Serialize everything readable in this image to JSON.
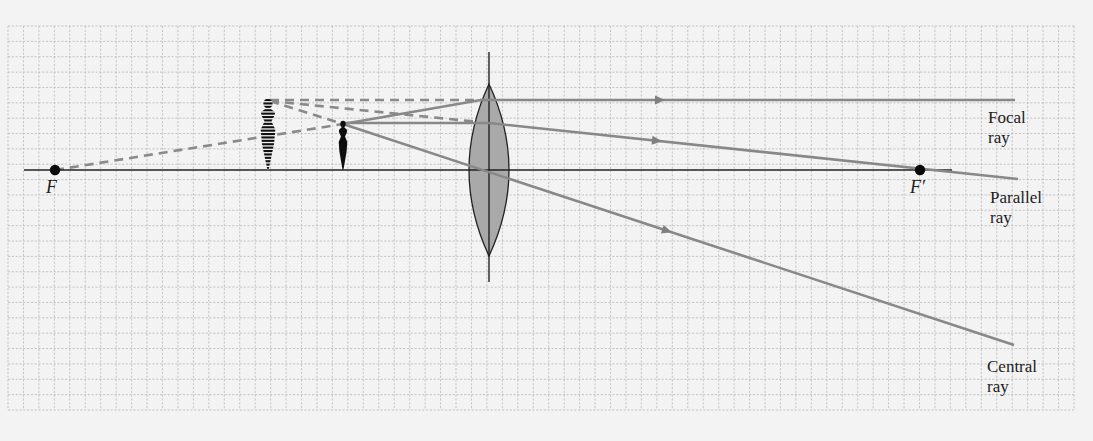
{
  "figure": {
    "colors": {
      "background": "#f3f3f3",
      "grid": "#b9b9b9",
      "ray": "#888888",
      "axis": "#222222",
      "lens_fill": "#a9a9a9"
    },
    "grid": {
      "x0": 8,
      "y0": 26,
      "x1": 1074,
      "y1": 410,
      "cols": 69,
      "rows": 25
    },
    "optical_axis": {
      "x_start": 24,
      "x_end": 952,
      "y": 170
    },
    "lens": {
      "x": 489,
      "axis_top": 52,
      "axis_bottom": 282,
      "top": 84,
      "bottom": 256,
      "half_width": 20
    },
    "focal_points": [
      {
        "id": "F",
        "label": "F",
        "x": 55,
        "y": 170
      },
      {
        "id": "F_prime",
        "label": "F′",
        "x": 920,
        "y": 170
      }
    ],
    "object": {
      "x": 343,
      "tip_y": 124,
      "base_y": 170
    },
    "image": {
      "x": 269,
      "tip_y": 100,
      "base_y": 170,
      "type": "virtual"
    },
    "rays": [
      {
        "name": "Focal ray",
        "label_line1": "Focal",
        "label_line2": "ray",
        "segments": [
          [
            343,
            124,
            481,
            100
          ],
          [
            481,
            100,
            1015,
            100
          ]
        ],
        "arrow_x": 661,
        "back_extension": [
          270,
          100,
          481,
          100
        ]
      },
      {
        "name": "Parallel ray",
        "label_line1": "Parallel",
        "label_line2": "ray",
        "segments": [
          [
            343,
            123,
            489,
            123
          ],
          [
            489,
            123,
            1018,
            179
          ]
        ],
        "arrow_x": 658,
        "back_extension": [
          270,
          101,
          489,
          123
        ]
      },
      {
        "name": "Central ray",
        "label_line1": "Central",
        "label_line2": "ray",
        "segments": [
          [
            343,
            124,
            1014,
            345
          ]
        ],
        "arrow_x": 668,
        "back_extension": [
          270,
          101,
          343,
          124
        ]
      }
    ],
    "focal_back_extension": [
      55,
      170,
      343,
      124
    ]
  },
  "labels": {
    "F": "F",
    "F_prime": "F′",
    "focal_ray_1": "Focal",
    "focal_ray_2": "ray",
    "parallel_ray_1": "Parallel",
    "parallel_ray_2": "ray",
    "central_ray_1": "Central",
    "central_ray_2": "ray"
  }
}
